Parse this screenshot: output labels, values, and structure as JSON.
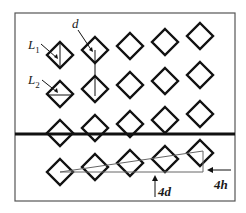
{
  "diagram": {
    "frame": {
      "x": 15,
      "y": 13,
      "w": 220,
      "h": 188,
      "color": "#555555"
    },
    "divider_line": {
      "y": 134,
      "color": "#111111"
    },
    "grid": {
      "columns": 5,
      "rows": 4,
      "col_x": [
        60,
        95,
        130,
        165,
        200
      ],
      "col_y_offset": [
        0,
        -5,
        -9,
        -13,
        -19
      ],
      "row_y": [
        55,
        94,
        133,
        172
      ],
      "half_size": 13,
      "stroke": "#111111"
    },
    "labels": {
      "L1": {
        "main": "L",
        "sub": "1"
      },
      "L2": {
        "main": "L",
        "sub": "2"
      },
      "d": "d",
      "four_d": "4d",
      "four_h": "4h"
    },
    "triangle": {
      "points": [
        [
          60,
          172
        ],
        [
          203,
          172
        ],
        [
          203,
          151
        ]
      ],
      "color": "#666666"
    }
  }
}
